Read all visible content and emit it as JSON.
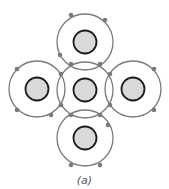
{
  "diagram": {
    "caption": "(a)",
    "colors": {
      "shell": "#7a7a7a",
      "nucleus_fill": "#d9d9d9",
      "nucleus_stroke": "#1a1a1a",
      "electron": "#7a7a7a"
    },
    "shell_radius": 28,
    "nucleus_radius": 11.5,
    "atoms": [
      {
        "name": "center",
        "cx": 85,
        "cy": 90
      },
      {
        "name": "top",
        "cx": 85,
        "cy": 42
      },
      {
        "name": "left",
        "cx": 37,
        "cy": 89
      },
      {
        "name": "right",
        "cx": 133,
        "cy": 89
      },
      {
        "name": "bottom",
        "cx": 85,
        "cy": 138
      }
    ],
    "electrons": [
      [
        71,
        15
      ],
      [
        105,
        20
      ],
      [
        60,
        55
      ],
      [
        71,
        64
      ],
      [
        100,
        64
      ],
      [
        17,
        69
      ],
      [
        17,
        110
      ],
      [
        51,
        115
      ],
      [
        61,
        74
      ],
      [
        61,
        105
      ],
      [
        154,
        69
      ],
      [
        154,
        110
      ],
      [
        110,
        74
      ],
      [
        110,
        105
      ],
      [
        71,
        115
      ],
      [
        100,
        115
      ],
      [
        108,
        125
      ],
      [
        71,
        165
      ],
      [
        100,
        165
      ]
    ]
  }
}
